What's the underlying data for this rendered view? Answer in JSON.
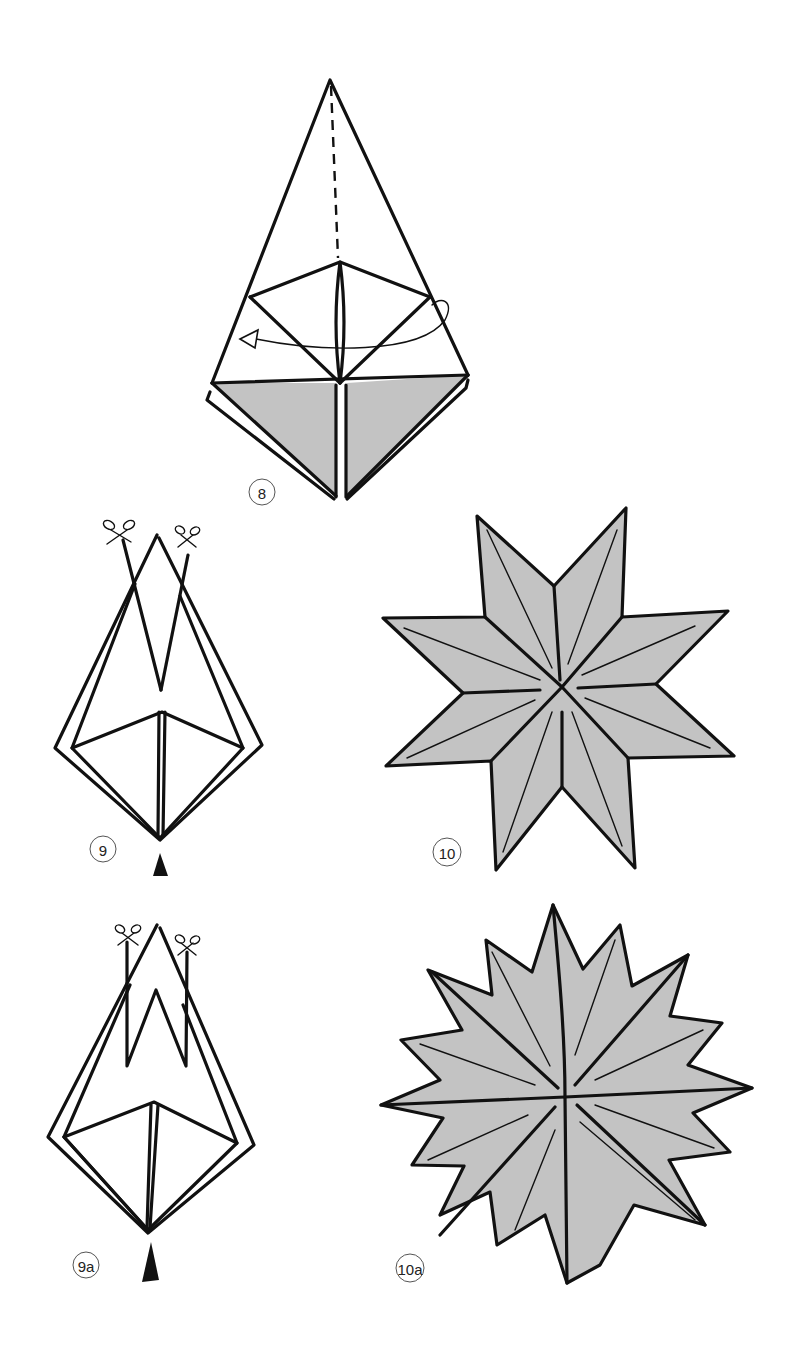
{
  "page": {
    "type": "origami instruction diagram",
    "background": "#ffffff",
    "line_color": "#111111",
    "shade_color": "#c3c3c3"
  },
  "steps": [
    {
      "id": "step-8",
      "label": "8",
      "description": "Folded kite-shaped base with dashed valley fold line to apex and curved turn-over arrow; lower triangles shaded",
      "symbols": [
        "dashed-fold-line",
        "turn-over-arrow"
      ]
    },
    {
      "id": "step-9",
      "label": "9",
      "description": "Folded base with V-shaped cut at top; scissors marks at both cut lines; push arrow at bottom",
      "symbols": [
        "scissors",
        "scissors",
        "push-arrow"
      ]
    },
    {
      "id": "step-9a",
      "label": "9a",
      "description": "Alternate: W-shaped cut at top; scissors marks; push arrow at bottom",
      "symbols": [
        "scissors",
        "scissors",
        "push-arrow"
      ]
    },
    {
      "id": "step-10",
      "label": "10",
      "description": "Finished 8-pointed star, shaded grey",
      "points": 8
    },
    {
      "id": "step-10a",
      "label": "10a",
      "description": "Finished 16-pointed star, shaded grey",
      "points": 16
    }
  ]
}
